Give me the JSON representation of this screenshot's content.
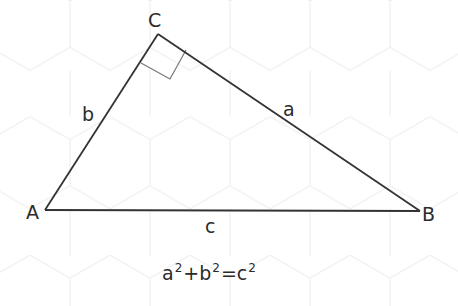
{
  "diagram": {
    "colors": {
      "background": "#ffffff",
      "hex_grid": "#ececec",
      "triangle_stroke": "#333333",
      "right_angle_marker": "#777777",
      "text": "#2b2b2b"
    },
    "vertices": {
      "A": {
        "label": "A",
        "x": 45,
        "y": 210
      },
      "B": {
        "label": "B",
        "x": 420,
        "y": 211
      },
      "C": {
        "label": "C",
        "x": 158,
        "y": 34
      }
    },
    "sides": {
      "a": {
        "label": "a",
        "from": "C",
        "to": "B"
      },
      "b": {
        "label": "b",
        "from": "A",
        "to": "C"
      },
      "c": {
        "label": "c",
        "from": "A",
        "to": "B"
      }
    },
    "right_angle_at": "C",
    "formula": {
      "term1_base": "a",
      "term1_exp": "2",
      "plus": "+",
      "term2_base": "b",
      "term2_exp": "2",
      "equals": "=",
      "term3_base": "c",
      "term3_exp": "2",
      "full_text": "a²+b²=c²"
    }
  }
}
